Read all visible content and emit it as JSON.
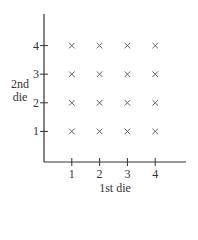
{
  "chart_data": {
    "type": "scatter",
    "title": "",
    "xlabel": "1st die",
    "ylabel": "2nd die",
    "ylabel_lines": [
      "2nd",
      "die"
    ],
    "x_ticks": [
      "1",
      "2",
      "3",
      "4"
    ],
    "y_ticks": [
      "1",
      "2",
      "3",
      "4"
    ],
    "marker": "x",
    "grid": false,
    "legend": null,
    "xlim": [
      0,
      5
    ],
    "ylim": [
      0,
      5
    ],
    "points": [
      {
        "x": 1,
        "y": 1
      },
      {
        "x": 2,
        "y": 1
      },
      {
        "x": 3,
        "y": 1
      },
      {
        "x": 4,
        "y": 1
      },
      {
        "x": 1,
        "y": 2
      },
      {
        "x": 2,
        "y": 2
      },
      {
        "x": 3,
        "y": 2
      },
      {
        "x": 4,
        "y": 2
      },
      {
        "x": 1,
        "y": 3
      },
      {
        "x": 2,
        "y": 3
      },
      {
        "x": 3,
        "y": 3
      },
      {
        "x": 4,
        "y": 3
      },
      {
        "x": 1,
        "y": 4
      },
      {
        "x": 2,
        "y": 4
      },
      {
        "x": 3,
        "y": 4
      },
      {
        "x": 4,
        "y": 4
      }
    ]
  },
  "colors": {
    "axis": "#333333",
    "marker": "#555555",
    "background": "#ffffff"
  }
}
